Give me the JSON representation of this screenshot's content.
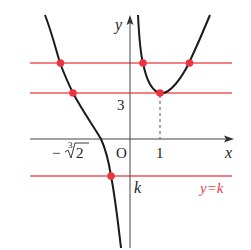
{
  "diagram": {
    "colors": {
      "axis": "#333333",
      "curve": "#1a1a1a",
      "horizontal_lines": "#f0545a",
      "points": "#ee3340",
      "red_label": "#e8404a"
    },
    "labels": {
      "y_axis": "y",
      "x_axis": "x",
      "origin": "O",
      "y_tick_3": "3",
      "x_tick_1": "1",
      "x_tick_neg_cuberoot2_minus": "−",
      "x_tick_neg_cuberoot2_index": "3",
      "x_tick_neg_cuberoot2_radicand": "2",
      "k_label": "k",
      "line_label": "y=k"
    },
    "horizontal_lines": [
      {
        "name": "upper",
        "intersections": 3
      },
      {
        "name": "tangent-at-minimum",
        "value": 3,
        "intersections": 2
      },
      {
        "name": "y=k",
        "value": "k",
        "intersections": 1
      }
    ],
    "minimum_point": {
      "x": 1,
      "y": 3
    },
    "asymptote": "x=0 (y-axis)",
    "zero": "-∛2"
  }
}
